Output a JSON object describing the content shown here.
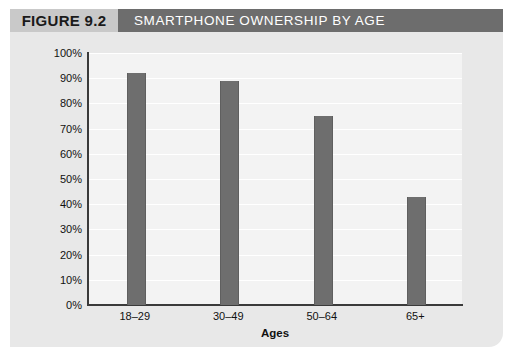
{
  "header": {
    "figure_tag": "FIGURE 9.2",
    "title": "SMARTPHONE OWNERSHIP BY AGE",
    "tag_bg": "#c9c9c9",
    "title_bg": "#6d6d6d",
    "title_color": "#ffffff"
  },
  "chart_data": {
    "type": "bar",
    "title": "SMARTPHONE OWNERSHIP BY AGE",
    "categories": [
      "18–29",
      "30–49",
      "50–64",
      "65+"
    ],
    "values": [
      92,
      89,
      75,
      43
    ],
    "value_labels": [
      "92%",
      "89%",
      "75%",
      "43%"
    ],
    "xlabel": "Ages",
    "ylabel": "",
    "ylim": [
      0,
      100
    ],
    "ytick_labels": [
      "100%",
      "90%",
      "80%",
      "70%",
      "60%",
      "50%",
      "40%",
      "30%",
      "20%",
      "10%",
      "0%"
    ],
    "ytick_values": [
      100,
      90,
      80,
      70,
      60,
      50,
      40,
      30,
      20,
      10,
      0
    ],
    "grid": true,
    "grid_color": "#ffffff",
    "legend": "none",
    "bar_color": "#6e6e6e",
    "plot_bg": "#f3f3f3",
    "panel_bg": "#e8e8e8"
  }
}
